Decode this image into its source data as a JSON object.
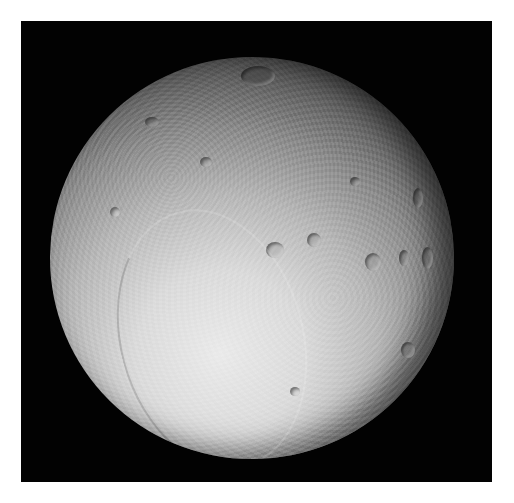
{
  "image": {
    "subject": "cratered icy moon",
    "description": "Grayscale photograph of a heavily cratered moon on a black background, lit from the lower left, with a white border around the frame",
    "colors": {
      "border": "#ffffff",
      "background": "#020202",
      "lit_surface": "#ebebeb",
      "shadowed_limb": "#0f0f0f"
    },
    "features": [
      {
        "name": "large-crater-top",
        "x": 258,
        "y": 75,
        "w": 34,
        "h": 20
      },
      {
        "name": "crater-right-1",
        "x": 373,
        "y": 262,
        "w": 16,
        "h": 18
      },
      {
        "name": "crater-right-2",
        "x": 404,
        "y": 258,
        "w": 10,
        "h": 16
      },
      {
        "name": "crater-right-3",
        "x": 427,
        "y": 258,
        "w": 11,
        "h": 22
      },
      {
        "name": "crater-right-upper",
        "x": 418,
        "y": 198,
        "w": 10,
        "h": 20
      },
      {
        "name": "crater-mid-1",
        "x": 275,
        "y": 250,
        "w": 18,
        "h": 16
      },
      {
        "name": "crater-mid-2",
        "x": 314,
        "y": 240,
        "w": 14,
        "h": 14
      },
      {
        "name": "crater-lower-right",
        "x": 408,
        "y": 350,
        "w": 14,
        "h": 16
      }
    ]
  }
}
